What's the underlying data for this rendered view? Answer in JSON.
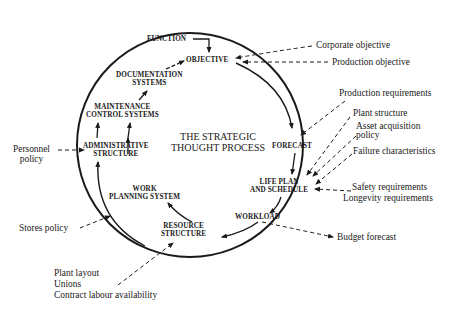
{
  "diagram": {
    "center_title": [
      "THE STRATEGIC",
      "THOUGHT PROCESS"
    ],
    "nodes": {
      "function": "FUNCTION",
      "objective": "OBJECTIVE",
      "forecast": "FORECAST",
      "life_plan": [
        "LIFE PLAN",
        "AND SCHEDULE"
      ],
      "workload": "WORKLOAD",
      "resource_structure": [
        "RESOURCE",
        "STRUCTURE"
      ],
      "work_planning_system": [
        "WORK",
        "PLANNING SYSTEM"
      ],
      "administrative_structure": [
        "ADMINISTRATIVE",
        "STRUCTURE"
      ],
      "maintenance_control_systems": [
        "MAINTENANCE",
        "CONTROL SYSTEMS"
      ],
      "documentation_systems": [
        "DOCUMENTATION",
        "SYSTEMS"
      ]
    },
    "external_inputs": {
      "corporate_objective": "Corporate objective",
      "production_objective": "Production objective",
      "production_requirements": "Production requirements",
      "plant_structure": "Plant structure",
      "asset_acquisition_policy": [
        "Asset acquisition",
        "policy"
      ],
      "failure_characteristics": "Failure characteristics",
      "safety_requirements": "Safety requirements",
      "longevity_requirements": "Longevity requirements",
      "budget_forecast": "Budget forecast",
      "personnel_policy": [
        "Personnel",
        "policy"
      ],
      "stores_policy": "Stores policy",
      "plant_layout": "Plant layout",
      "unions": "Unions",
      "contract_labour_availability": "Contract labour availability"
    },
    "colors": {
      "ink": "#1a1a1a",
      "background": "#ffffff"
    }
  }
}
